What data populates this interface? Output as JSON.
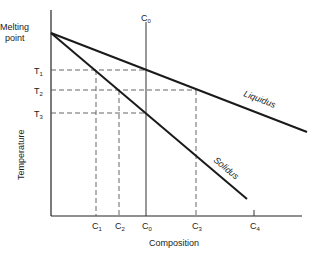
{
  "diagram": {
    "y_axis": {
      "label": "Temperature",
      "top_label_line1": "Melting",
      "top_label_line2": "point"
    },
    "x_axis": {
      "label": "Composition"
    },
    "temperatures": [
      {
        "base": "T",
        "sub": "1"
      },
      {
        "base": "T",
        "sub": "2"
      },
      {
        "base": "T",
        "sub": "3"
      }
    ],
    "compositions": [
      {
        "base": "C",
        "sub": "1"
      },
      {
        "base": "C",
        "sub": "2"
      },
      {
        "base": "C",
        "sub": "0"
      },
      {
        "base": "C",
        "sub": "3"
      },
      {
        "base": "C",
        "sub": "4"
      }
    ],
    "top_composition": {
      "base": "C",
      "sub": "0"
    },
    "lines": {
      "liquidus": "Liquidus",
      "solidus": "Solidus"
    },
    "colors": {
      "line": "#1a1a1a",
      "dashed": "#555555"
    }
  }
}
